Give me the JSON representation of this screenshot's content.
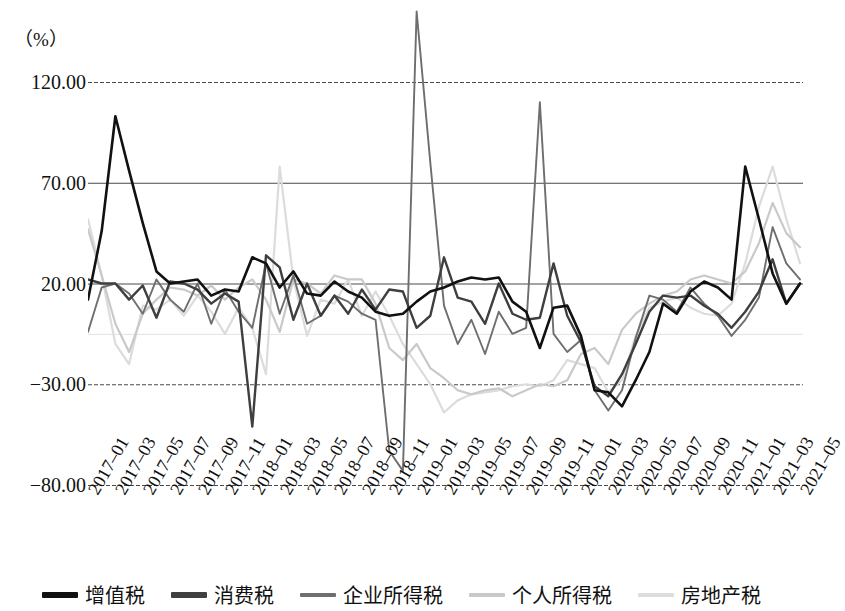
{
  "axis": {
    "unit_label": "（%）",
    "y_ticks": [
      "120.00",
      "70.00",
      "20.00",
      "-30.00",
      "-80.00"
    ],
    "x_tick_labels": [
      "2017-01",
      "2017-03",
      "2017-05",
      "2017-07",
      "2017-09",
      "2017-11",
      "2018-01",
      "2018-03",
      "2018-05",
      "2018-07",
      "2018-09",
      "2018-11",
      "2019-01",
      "2019-03",
      "2019-05",
      "2019-07",
      "2019-09",
      "2019-11",
      "2020-01",
      "2020-03",
      "2020-05",
      "2020-07",
      "2020-09",
      "2020-11",
      "2021-01",
      "2021-03",
      "2021-05"
    ]
  },
  "legend": {
    "items": [
      {
        "label": "增值税",
        "color": "#111111"
      },
      {
        "label": "消费税",
        "color": "#3f3f3f"
      },
      {
        "label": "企业所得税",
        "color": "#6e6e6e"
      },
      {
        "label": "个人所得税",
        "color": "#c9c9c9"
      },
      {
        "label": "房地产税",
        "color": "#dcdcdc"
      }
    ]
  },
  "chart_data": {
    "type": "line",
    "title": "",
    "xlabel": "",
    "ylabel": "（%）",
    "ylim": [
      -80,
      140
    ],
    "yticks": [
      120,
      70,
      20,
      -30,
      -80
    ],
    "grid": true,
    "legend_position": "bottom",
    "x": [
      "2017-01",
      "2017-02",
      "2017-03",
      "2017-04",
      "2017-05",
      "2017-06",
      "2017-07",
      "2017-08",
      "2017-09",
      "2017-10",
      "2017-11",
      "2017-12",
      "2018-01",
      "2018-02",
      "2018-03",
      "2018-04",
      "2018-05",
      "2018-06",
      "2018-07",
      "2018-08",
      "2018-09",
      "2018-10",
      "2018-11",
      "2018-12",
      "2019-01",
      "2019-02",
      "2019-03",
      "2019-04",
      "2019-05",
      "2019-06",
      "2019-07",
      "2019-08",
      "2019-09",
      "2019-10",
      "2019-11",
      "2019-12",
      "2020-01",
      "2020-02",
      "2020-03",
      "2020-04",
      "2020-05",
      "2020-06",
      "2020-07",
      "2020-08",
      "2020-09",
      "2020-10",
      "2020-11",
      "2020-12",
      "2021-01",
      "2021-02",
      "2021-03",
      "2021-04",
      "2021-05"
    ],
    "series": [
      {
        "name": "增值税",
        "color": "#111111",
        "values": [
          12,
          46,
          103,
          76,
          50,
          26,
          20,
          21,
          22,
          14,
          17,
          16,
          33,
          30,
          18,
          26,
          15,
          14,
          21,
          16,
          13,
          6,
          4,
          5,
          11,
          16,
          18,
          21,
          23,
          22,
          23,
          11,
          6,
          -12,
          8,
          9,
          -6,
          -33,
          -34,
          -41,
          -28,
          -14,
          10,
          5,
          16,
          21,
          18,
          12,
          78,
          52,
          25,
          10,
          20
        ]
      },
      {
        "name": "消费税",
        "color": "#3f3f3f",
        "values": [
          22,
          20,
          20,
          12,
          19,
          3,
          21,
          20,
          17,
          10,
          15,
          11,
          -51,
          34,
          28,
          2,
          20,
          4,
          14,
          5,
          17,
          7,
          17,
          16,
          -2,
          4,
          33,
          13,
          11,
          0,
          20,
          5,
          2,
          3,
          30,
          4,
          -9,
          -31,
          -36,
          -25,
          -10,
          6,
          14,
          13,
          14,
          9,
          5,
          -2,
          6,
          16,
          32,
          10,
          20
        ]
      },
      {
        "name": "企业所得税",
        "color": "#6e6e6e",
        "values": [
          -4,
          18,
          20,
          15,
          5,
          22,
          12,
          6,
          20,
          0,
          17,
          6,
          -2,
          30,
          5,
          24,
          0,
          4,
          14,
          11,
          5,
          2,
          -63,
          -73,
          155,
          80,
          9,
          -10,
          2,
          -15,
          6,
          -5,
          -2,
          110,
          -5,
          -14,
          -8,
          -33,
          -43,
          -33,
          -7,
          14,
          12,
          6,
          18,
          10,
          4,
          -6,
          2,
          13,
          48,
          30,
          22
        ]
      },
      {
        "name": "个人所得税",
        "color": "#c9c9c9",
        "values": [
          47,
          24,
          0,
          -14,
          5,
          12,
          18,
          17,
          14,
          19,
          12,
          18,
          22,
          12,
          -4,
          22,
          20,
          15,
          24,
          22,
          22,
          10,
          -12,
          -18,
          -10,
          -22,
          -27,
          -33,
          -35,
          -33,
          -32,
          -36,
          -33,
          -30,
          -31,
          -28,
          -15,
          -12,
          -20,
          -3,
          5,
          10,
          14,
          16,
          22,
          24,
          22,
          20,
          26,
          40,
          60,
          45,
          38
        ]
      },
      {
        "name": "房地产税",
        "color": "#dcdcdc",
        "values": [
          52,
          24,
          -10,
          -20,
          9,
          7,
          12,
          4,
          14,
          6,
          -5,
          8,
          -2,
          -25,
          78,
          22,
          -6,
          12,
          10,
          22,
          4,
          16,
          4,
          -10,
          -20,
          -30,
          -44,
          -38,
          -35,
          -34,
          -33,
          -31,
          -30,
          -31,
          -28,
          -18,
          -20,
          -22,
          -34,
          -28,
          -6,
          8,
          11,
          13,
          8,
          5,
          4,
          10,
          30,
          58,
          78,
          52,
          30
        ]
      }
    ]
  }
}
